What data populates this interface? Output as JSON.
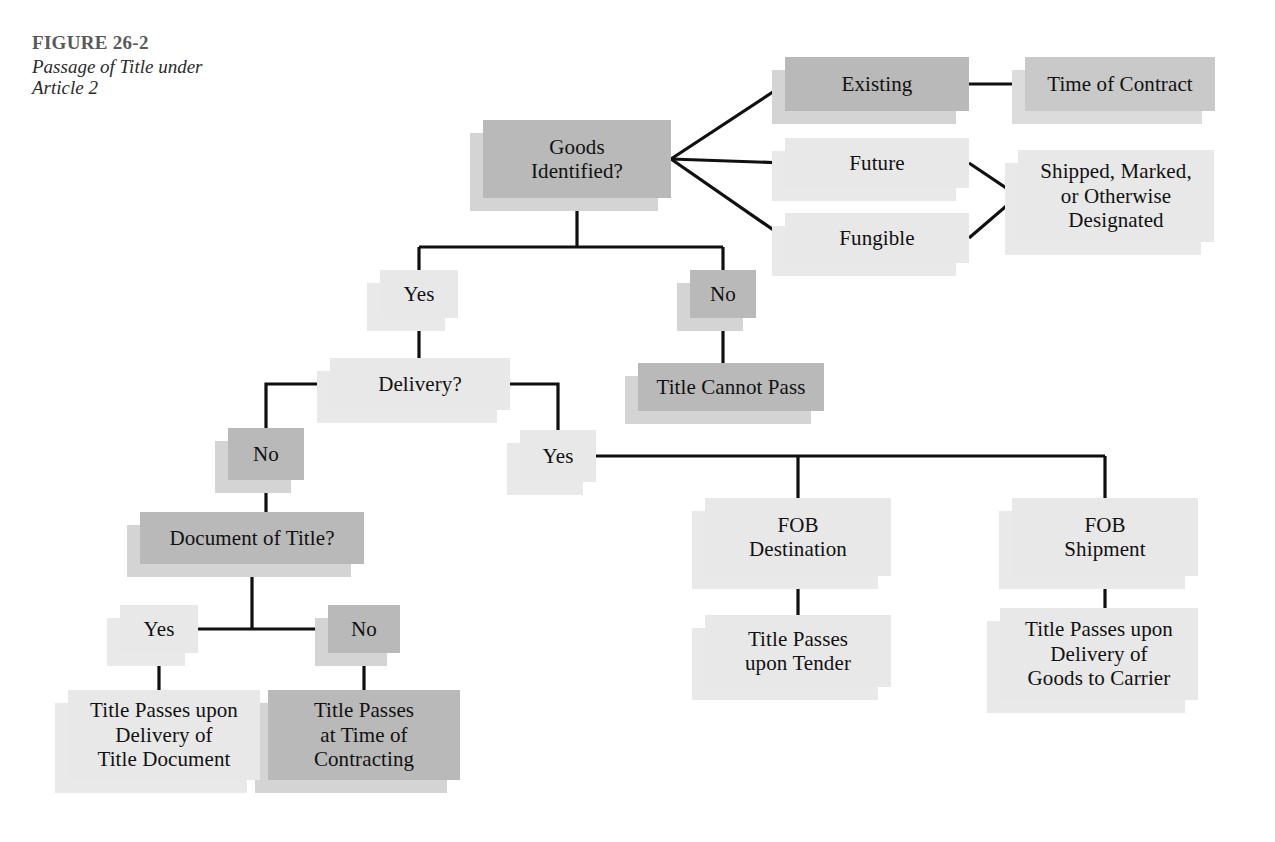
{
  "figure": {
    "title": "FIGURE 26-2",
    "subtitle": "Passage of Title under\nArticle 2",
    "title_color": "#595959",
    "subtitle_color": "#2b2b2b"
  },
  "palette": {
    "dark_fill": "#b9b9b9",
    "mid_fill": "#c9c9c9",
    "light_fill": "#e8e8e8",
    "pale_fill": "#ededed",
    "edge_color": "#101010",
    "page_background": "#ffffff"
  },
  "chart_data": {
    "type": "diagram",
    "title": "Passage of Title under Article 2",
    "diagram_kind": "decision-flowchart",
    "nodes": [
      {
        "id": "goods-identified",
        "label": "Goods\nIdentified?",
        "tone": "dark",
        "x": 483,
        "y": 120,
        "w": 188,
        "h": 78,
        "font": 21
      },
      {
        "id": "existing",
        "label": "Existing",
        "tone": "dark",
        "x": 785,
        "y": 57,
        "w": 184,
        "h": 54,
        "font": 21
      },
      {
        "id": "time-of-contract",
        "label": "Time of Contract",
        "tone": "mid",
        "x": 1025,
        "y": 57,
        "w": 190,
        "h": 54,
        "font": 21
      },
      {
        "id": "future",
        "label": "Future",
        "tone": "light",
        "x": 785,
        "y": 138,
        "w": 184,
        "h": 50,
        "font": 21
      },
      {
        "id": "fungible",
        "label": "Fungible",
        "tone": "light",
        "x": 785,
        "y": 213,
        "w": 184,
        "h": 50,
        "font": 21
      },
      {
        "id": "shipped-marked",
        "label": "Shipped, Marked,\nor Otherwise\nDesignated",
        "tone": "light",
        "x": 1018,
        "y": 150,
        "w": 196,
        "h": 92,
        "font": 21
      },
      {
        "id": "yes-identified",
        "label": "Yes",
        "tone": "light",
        "x": 380,
        "y": 270,
        "w": 78,
        "h": 48,
        "font": 21
      },
      {
        "id": "no-identified",
        "label": "No",
        "tone": "dark",
        "x": 690,
        "y": 270,
        "w": 66,
        "h": 48,
        "font": 21
      },
      {
        "id": "title-cannot-pass",
        "label": "Title Cannot Pass",
        "tone": "dark",
        "x": 638,
        "y": 363,
        "w": 186,
        "h": 48,
        "font": 21
      },
      {
        "id": "delivery",
        "label": "Delivery?",
        "tone": "light",
        "x": 330,
        "y": 358,
        "w": 180,
        "h": 52,
        "font": 21
      },
      {
        "id": "no-delivery",
        "label": "No",
        "tone": "dark",
        "x": 228,
        "y": 428,
        "w": 76,
        "h": 52,
        "font": 21
      },
      {
        "id": "yes-delivery",
        "label": "Yes",
        "tone": "light",
        "x": 520,
        "y": 430,
        "w": 76,
        "h": 52,
        "font": 21
      },
      {
        "id": "document-of-title",
        "label": "Document of Title?",
        "tone": "dark",
        "x": 140,
        "y": 512,
        "w": 224,
        "h": 52,
        "font": 21
      },
      {
        "id": "yes-document",
        "label": "Yes",
        "tone": "light",
        "x": 120,
        "y": 605,
        "w": 78,
        "h": 48,
        "font": 21
      },
      {
        "id": "no-document",
        "label": "No",
        "tone": "dark",
        "x": 328,
        "y": 605,
        "w": 72,
        "h": 48,
        "font": 21
      },
      {
        "id": "title-passes-doc",
        "label": "Title Passes upon\nDelivery of\nTitle Document",
        "tone": "light",
        "x": 68,
        "y": 690,
        "w": 192,
        "h": 90,
        "font": 21
      },
      {
        "id": "title-passes-time",
        "label": "Title Passes\nat Time of\nContracting",
        "tone": "dark",
        "x": 268,
        "y": 690,
        "w": 192,
        "h": 90,
        "font": 21
      },
      {
        "id": "fob-destination",
        "label": "FOB\nDestination",
        "tone": "light",
        "x": 705,
        "y": 498,
        "w": 186,
        "h": 78,
        "font": 21
      },
      {
        "id": "fob-shipment",
        "label": "FOB\nShipment",
        "tone": "light",
        "x": 1012,
        "y": 498,
        "w": 186,
        "h": 78,
        "font": 21
      },
      {
        "id": "title-passes-tender",
        "label": "Title Passes\nupon Tender",
        "tone": "light",
        "x": 705,
        "y": 615,
        "w": 186,
        "h": 72,
        "font": 21
      },
      {
        "id": "title-passes-carrier",
        "label": "Title Passes upon\nDelivery of\nGoods to Carrier",
        "tone": "light",
        "x": 1000,
        "y": 608,
        "w": 198,
        "h": 92,
        "font": 21
      }
    ],
    "edges": [
      {
        "from": "goods-identified",
        "to": "existing",
        "kind": "diagonal"
      },
      {
        "from": "goods-identified",
        "to": "future",
        "kind": "horizontal"
      },
      {
        "from": "goods-identified",
        "to": "fungible",
        "kind": "diagonal"
      },
      {
        "from": "existing",
        "to": "time-of-contract",
        "kind": "horizontal"
      },
      {
        "from": "future",
        "to": "shipped-marked",
        "kind": "diagonal"
      },
      {
        "from": "fungible",
        "to": "shipped-marked",
        "kind": "diagonal"
      },
      {
        "from": "goods-identified",
        "to": "yes-identified",
        "kind": "orthogonal"
      },
      {
        "from": "goods-identified",
        "to": "no-identified",
        "kind": "orthogonal"
      },
      {
        "from": "no-identified",
        "to": "title-cannot-pass",
        "kind": "vertical"
      },
      {
        "from": "yes-identified",
        "to": "delivery",
        "kind": "vertical"
      },
      {
        "from": "delivery",
        "to": "no-delivery",
        "kind": "orthogonal"
      },
      {
        "from": "delivery",
        "to": "yes-delivery",
        "kind": "orthogonal"
      },
      {
        "from": "no-delivery",
        "to": "document-of-title",
        "kind": "vertical"
      },
      {
        "from": "document-of-title",
        "to": "yes-document",
        "kind": "orthogonal"
      },
      {
        "from": "document-of-title",
        "to": "no-document",
        "kind": "orthogonal"
      },
      {
        "from": "yes-document",
        "to": "title-passes-doc",
        "kind": "vertical"
      },
      {
        "from": "no-document",
        "to": "title-passes-time",
        "kind": "vertical"
      },
      {
        "from": "yes-delivery",
        "to": "fob-destination",
        "kind": "orthogonal"
      },
      {
        "from": "yes-delivery",
        "to": "fob-shipment",
        "kind": "orthogonal"
      },
      {
        "from": "fob-destination",
        "to": "title-passes-tender",
        "kind": "vertical"
      },
      {
        "from": "fob-shipment",
        "to": "title-passes-carrier",
        "kind": "vertical"
      }
    ]
  }
}
